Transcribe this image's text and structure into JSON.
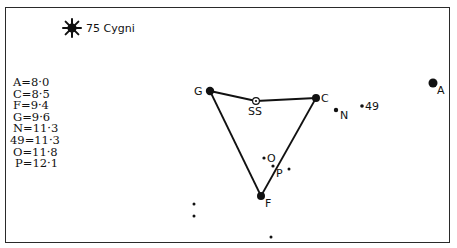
{
  "title": {
    "label": "75 Cygni",
    "icon": "sun-star-icon"
  },
  "legend": {
    "items": [
      {
        "star": "A",
        "magnitude": "8·0"
      },
      {
        "star": "C",
        "magnitude": "8·5"
      },
      {
        "star": "F",
        "magnitude": "9·4"
      },
      {
        "star": "G",
        "magnitude": "9·6"
      },
      {
        "star": "N",
        "magnitude": "11·3"
      },
      {
        "star": "49",
        "magnitude": "11·3"
      },
      {
        "star": "O",
        "magnitude": "11·8"
      },
      {
        "star": "P",
        "magnitude": "12·1"
      }
    ]
  },
  "stars": {
    "G": {
      "label": "G",
      "x": 210,
      "y": 91,
      "r": 4.2
    },
    "C": {
      "label": "C",
      "x": 316,
      "y": 98,
      "r": 4.0
    },
    "F": {
      "label": "F",
      "x": 261,
      "y": 196,
      "r": 4.0
    },
    "A": {
      "label": "A",
      "x": 433,
      "y": 83,
      "r": 4.5
    },
    "N": {
      "label": "N",
      "x": 336,
      "y": 110,
      "r": 2.2
    },
    "n49": {
      "label": "49",
      "x": 362,
      "y": 106,
      "r": 1.8
    },
    "O": {
      "label": "O",
      "x": 264,
      "y": 158,
      "r": 1.6
    },
    "P": {
      "label": "P",
      "x": 273,
      "y": 166,
      "r": 1.6
    },
    "SS": {
      "label": "SS",
      "x": 256,
      "y": 101
    }
  },
  "field_stars": [
    {
      "x": 289,
      "y": 169
    },
    {
      "x": 194,
      "y": 204
    },
    {
      "x": 194,
      "y": 216
    },
    {
      "x": 271,
      "y": 237
    }
  ]
}
